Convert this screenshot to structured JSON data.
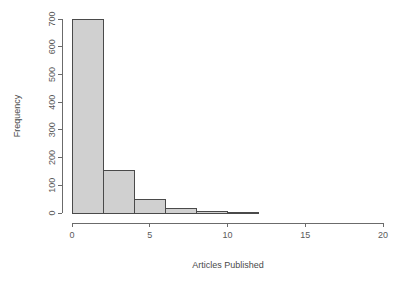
{
  "chart_data": {
    "type": "bar",
    "subtype": "histogram",
    "title": "",
    "xlabel": "Articles Published",
    "ylabel": "Frequency",
    "xlim": [
      0,
      20
    ],
    "ylim": [
      0,
      700
    ],
    "binwidth": 2,
    "grid": false,
    "legend": null,
    "xticks": [
      0,
      5,
      10,
      15,
      20
    ],
    "xtick_labels": [
      "0",
      "5",
      "10",
      "15",
      "20"
    ],
    "yticks": [
      0,
      100,
      200,
      300,
      400,
      500,
      600,
      700
    ],
    "ytick_labels": [
      "0",
      "100",
      "200",
      "300",
      "400",
      "500",
      "600",
      "700"
    ],
    "bins": [
      {
        "x0": 0,
        "x1": 2,
        "value": 700
      },
      {
        "x0": 2,
        "x1": 4,
        "value": 152
      },
      {
        "x0": 4,
        "x1": 6,
        "value": 47
      },
      {
        "x0": 6,
        "x1": 8,
        "value": 17
      },
      {
        "x0": 8,
        "x1": 10,
        "value": 4
      },
      {
        "x0": 10,
        "x1": 12,
        "value": 2
      }
    ],
    "categories": [
      "0-2",
      "2-4",
      "4-6",
      "6-8",
      "8-10",
      "10-12"
    ],
    "values": [
      700,
      152,
      47,
      17,
      4,
      2
    ],
    "colors": {
      "bar_fill": "#d0d0d0",
      "bar_stroke": "#4a4a4a",
      "axis": "#6b6b6b",
      "text": "#4a4a4a",
      "background": "#ffffff"
    }
  },
  "layout": {
    "plot_left": 72,
    "plot_right": 383,
    "baseline_y": 213,
    "top_y": 19,
    "axis_x": 62,
    "x_axis_y": 223
  }
}
